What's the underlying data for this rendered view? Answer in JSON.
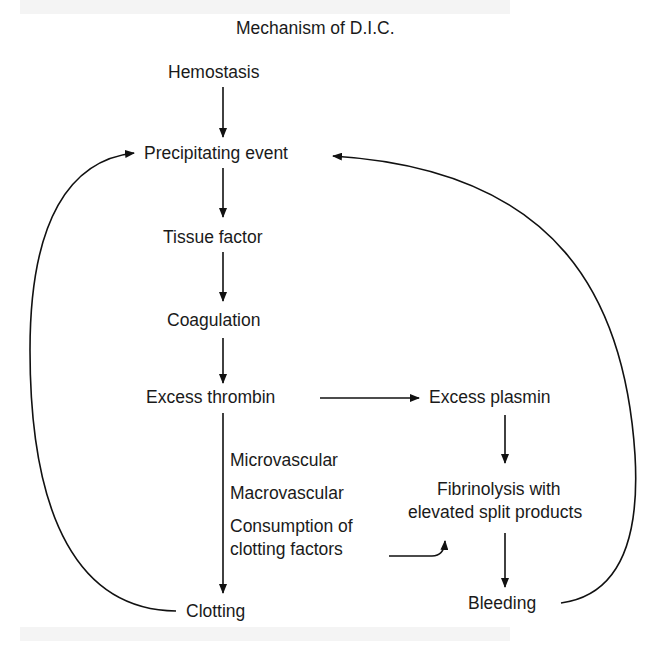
{
  "diagram": {
    "title": "Mechanism of D.I.C.",
    "nodes": {
      "hemostasis": "Hemostasis",
      "precipitating_event": "Precipitating event",
      "tissue_factor": "Tissue factor",
      "coagulation": "Coagulation",
      "excess_thrombin": "Excess thrombin",
      "excess_plasmin": "Excess plasmin",
      "microvascular": "Microvascular",
      "macrovascular": "Macrovascular",
      "consumption_line1": "Consumption of",
      "consumption_line2": "clotting factors",
      "fibrinolysis_line1": "Fibrinolysis with",
      "fibrinolysis_line2": "elevated split products",
      "clotting": "Clotting",
      "bleeding": "Bleeding"
    },
    "edges": [
      {
        "from": "Hemostasis",
        "to": "Precipitating event"
      },
      {
        "from": "Precipitating event",
        "to": "Tissue factor"
      },
      {
        "from": "Tissue factor",
        "to": "Coagulation"
      },
      {
        "from": "Coagulation",
        "to": "Excess thrombin"
      },
      {
        "from": "Excess thrombin",
        "to": "Excess plasmin"
      },
      {
        "from": "Excess thrombin",
        "to": "Clotting"
      },
      {
        "from": "Excess plasmin",
        "to": "Fibrinolysis with elevated split products"
      },
      {
        "from": "Consumption of clotting factors",
        "to": "Fibrinolysis with elevated split products"
      },
      {
        "from": "Fibrinolysis with elevated split products",
        "to": "Bleeding"
      },
      {
        "from": "Clotting",
        "to": "Precipitating event"
      },
      {
        "from": "Bleeding",
        "to": "Precipitating event"
      }
    ],
    "colors": {
      "line": "#111111",
      "text": "#1a1a1a",
      "band": "#f4f4f4"
    }
  }
}
